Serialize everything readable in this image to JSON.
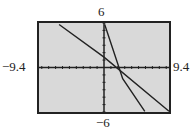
{
  "window": {
    "xmin": "-9.4",
    "xmax": "9.4",
    "ymin": "-6",
    "ymax": "6"
  },
  "labels": {
    "ymax": "6",
    "ymin": "−6",
    "xmin": "−9.4",
    "xmax": "9.4"
  },
  "colors": {
    "screen_bg": "#d9d9d9",
    "frame": "#222222",
    "plot": "#222222"
  },
  "chart_data": {
    "type": "line",
    "title": "",
    "xlabel": "",
    "ylabel": "",
    "xlim": [
      -9.4,
      9.4
    ],
    "ylim": [
      -6,
      6
    ],
    "x_ticks": "1 unit spacing",
    "y_ticks": "1 unit spacing",
    "grid": false,
    "series": [
      {
        "name": "line 1 (shallow)",
        "points": [
          [
            -6.5,
            5.8
          ],
          [
            0,
            1.4
          ],
          [
            9.4,
            -5.9
          ]
        ]
      },
      {
        "name": "line 2 (steep)",
        "points": [
          [
            0.1,
            5.8
          ],
          [
            2.7,
            -1.5
          ],
          [
            5.9,
            -5.9
          ]
        ]
      }
    ],
    "annotations": [
      "lines intersect near (4, -2.4)"
    ]
  }
}
